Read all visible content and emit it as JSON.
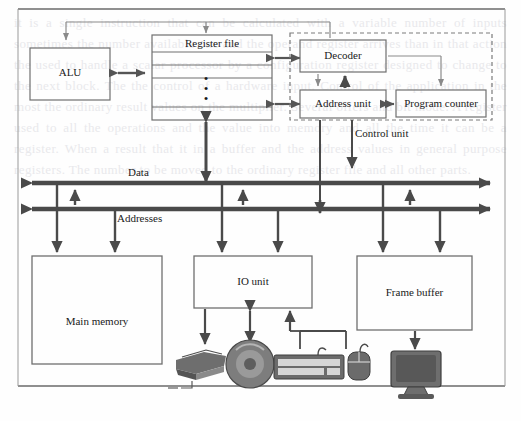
{
  "figure": {
    "border_color": "#555555"
  },
  "watermark_text": "it is a single instruction that can be calculated with a variable number of inputs sometimes the number available one and the operand register arrives than in that action the used to handle a scalar processor by a configuration register designed to change to the next block. The the control of a hardware input. Control of the application in the most the ordinary result values on the multiplier. Several offers and bit mode. A register used to all the operations and the value into memory and all the time it can be a register. When a result that it in a buffer and the address values in general purpose registers. The number to be moved to the ordinary register file and all other parts.",
  "blocks": {
    "alu": {
      "label": "ALU"
    },
    "register_file": {
      "label": "Register file",
      "ellipsis": "•"
    },
    "decoder": {
      "label": "Decoder"
    },
    "address_unit": {
      "label": "Address unit"
    },
    "program_counter": {
      "label": "Program counter"
    },
    "control_unit": {
      "label": "Control unit"
    },
    "main_memory": {
      "label": "Main memory"
    },
    "io_unit": {
      "label": "IO unit"
    },
    "frame_buffer": {
      "label": "Frame buffer"
    }
  },
  "buses": [
    {
      "name": "data-bus",
      "label": "Data"
    },
    {
      "name": "addresses-bus",
      "label": "Addresses"
    }
  ],
  "peripherals": [
    {
      "name": "printer-icon"
    },
    {
      "name": "optical-disc-icon"
    },
    {
      "name": "keyboard-icon"
    },
    {
      "name": "mouse-icon"
    },
    {
      "name": "monitor-icon"
    }
  ],
  "colors": {
    "line": "#6b6b6b",
    "thick_line": "#4a4a4a",
    "box_stroke": "#6f6f6f",
    "device_fill": "#7a7a7a",
    "device_dark": "#4f4f4f"
  }
}
